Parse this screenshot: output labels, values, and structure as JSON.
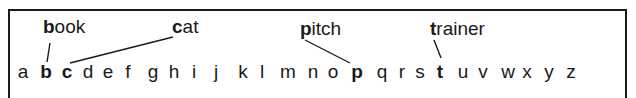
{
  "diagram": {
    "alphabet": [
      {
        "char": "a",
        "x": 23,
        "highlighted": false
      },
      {
        "char": "b",
        "x": 46,
        "highlighted": true
      },
      {
        "char": "c",
        "x": 67,
        "highlighted": true
      },
      {
        "char": "d",
        "x": 88,
        "highlighted": false
      },
      {
        "char": "e",
        "x": 108,
        "highlighted": false
      },
      {
        "char": "f",
        "x": 128,
        "highlighted": false
      },
      {
        "char": "g",
        "x": 153,
        "highlighted": false
      },
      {
        "char": "h",
        "x": 174,
        "highlighted": false
      },
      {
        "char": "i",
        "x": 194,
        "highlighted": false
      },
      {
        "char": "j",
        "x": 216,
        "highlighted": false
      },
      {
        "char": "k",
        "x": 243,
        "highlighted": false
      },
      {
        "char": "l",
        "x": 262,
        "highlighted": false
      },
      {
        "char": "m",
        "x": 288,
        "highlighted": false
      },
      {
        "char": "n",
        "x": 313,
        "highlighted": false
      },
      {
        "char": "o",
        "x": 333,
        "highlighted": false
      },
      {
        "char": "p",
        "x": 357,
        "highlighted": true
      },
      {
        "char": "q",
        "x": 382,
        "highlighted": false
      },
      {
        "char": "r",
        "x": 402,
        "highlighted": false
      },
      {
        "char": "s",
        "x": 420,
        "highlighted": false
      },
      {
        "char": "t",
        "x": 440,
        "highlighted": true
      },
      {
        "char": "u",
        "x": 463,
        "highlighted": false
      },
      {
        "char": "v",
        "x": 483,
        "highlighted": false
      },
      {
        "char": "w",
        "x": 508,
        "highlighted": false
      },
      {
        "char": "x",
        "x": 527,
        "highlighted": false
      },
      {
        "char": "y",
        "x": 549,
        "highlighted": false
      },
      {
        "char": "z",
        "x": 571,
        "highlighted": false
      }
    ],
    "words": [
      {
        "word": "book",
        "first": "b",
        "rest": "ook",
        "x": 43,
        "target_letter": "b",
        "line": [
          50,
          43,
          47,
          62
        ]
      },
      {
        "word": "cat",
        "first": "c",
        "rest": "at",
        "x": 172,
        "target_letter": "c",
        "line": [
          173,
          37,
          70,
          63
        ]
      },
      {
        "word": "pitch",
        "first": "p",
        "rest": "itch",
        "x": 300,
        "target_letter": "p",
        "line": [
          305,
          40,
          350,
          63
        ]
      },
      {
        "word": "trainer",
        "first": "t",
        "rest": "rainer",
        "x": 430,
        "target_letter": "t",
        "line": [
          434,
          40,
          441,
          58
        ]
      }
    ],
    "colors": {
      "ink": "#1a1a1a",
      "background": "#ffffff"
    }
  }
}
